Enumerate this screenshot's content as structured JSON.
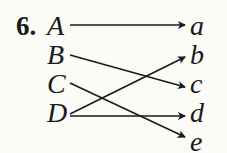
{
  "problem_number": "6.",
  "domain_labels": [
    "A",
    "B",
    "C",
    "D"
  ],
  "codomain_labels": [
    "a",
    "b",
    "c",
    "d",
    "e"
  ],
  "mapping": [
    {
      "from": "A",
      "to": "a"
    },
    {
      "from": "B",
      "to": "c"
    },
    {
      "from": "C",
      "to": "e"
    },
    {
      "from": "D",
      "to": "b"
    },
    {
      "from": "D",
      "to": "d"
    }
  ]
}
